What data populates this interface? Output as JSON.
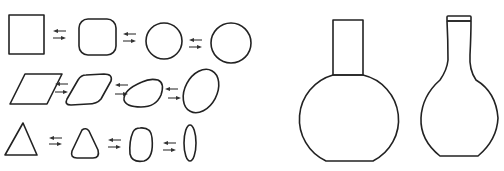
{
  "diagram": {
    "title": "",
    "stroke_color": "#222222",
    "background": "#ffffff",
    "left_panel": {
      "description": "Three rows of shape morphing sequences connected by reversible arrows",
      "rows": [
        {
          "name": "square-to-circle",
          "shapes": [
            "square",
            "rounded-square",
            "circle",
            "circle"
          ],
          "connectors": [
            "reversible-arrow",
            "reversible-arrow",
            "reversible-arrow"
          ]
        },
        {
          "name": "parallelogram-to-ellipse",
          "shapes": [
            "parallelogram",
            "rounded-parallelogram",
            "rounded-blob",
            "tilted-ellipse"
          ],
          "connectors": [
            "reversible-arrow",
            "reversible-arrow",
            "reversible-arrow"
          ]
        },
        {
          "name": "triangle-to-ellipse",
          "shapes": [
            "triangle",
            "rounded-triangle",
            "rounded-egg",
            "narrow-ellipse"
          ],
          "connectors": [
            "reversible-arrow",
            "reversible-arrow",
            "reversible-arrow"
          ]
        }
      ]
    },
    "right_panel": {
      "description": "Two flask/vase outlines",
      "vessels": [
        {
          "name": "geometric-flask",
          "parts": [
            "rectangular-neck",
            "truncated-circle-body"
          ]
        },
        {
          "name": "smooth-flask",
          "parts": [
            "flared-rim",
            "tapered-neck",
            "rounded-body"
          ]
        }
      ]
    }
  }
}
